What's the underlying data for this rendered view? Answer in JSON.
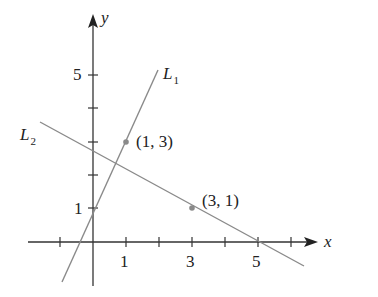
{
  "diagram": {
    "axes": {
      "x_label": "x",
      "y_label": "y",
      "x_tick_labels": [
        "1",
        "3",
        "5"
      ],
      "y_tick_labels": [
        "1",
        "5"
      ]
    },
    "lines": [
      {
        "name": "L",
        "subscript": "1",
        "passes_through": [
          [
            0,
            1
          ],
          [
            1,
            3
          ]
        ],
        "slope": 2
      },
      {
        "name": "L",
        "subscript": "2",
        "passes_through": [
          [
            1,
            3
          ],
          [
            3,
            1
          ]
        ],
        "slope": -0.5
      }
    ],
    "points": [
      {
        "label": "(1, 3)",
        "x": 1,
        "y": 3
      },
      {
        "label": "(3, 1)",
        "x": 3,
        "y": 1
      }
    ],
    "colors": {
      "axis": "#333333",
      "line": "#8a8a8a",
      "point": "#8a8a8a",
      "text": "#222222"
    }
  }
}
